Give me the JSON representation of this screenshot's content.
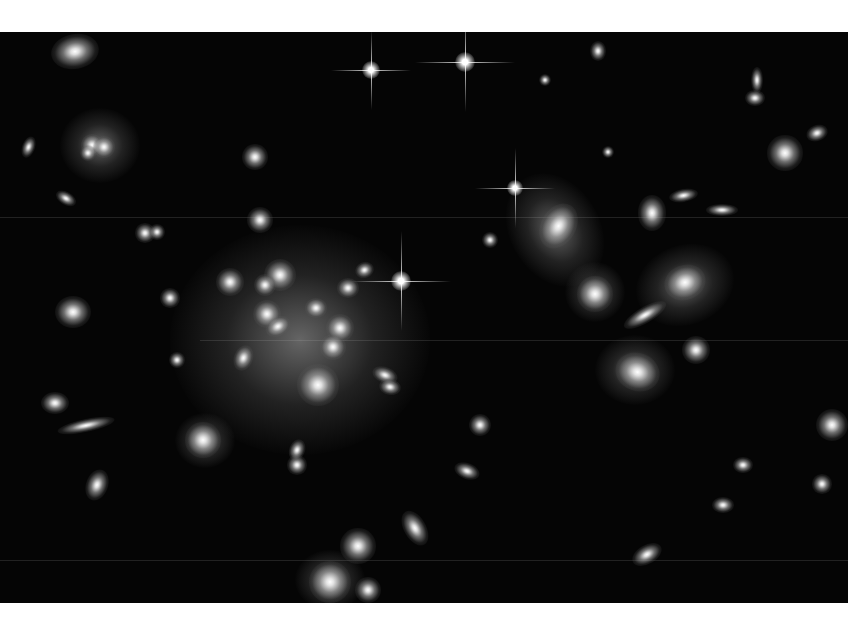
{
  "image": {
    "subject": "galaxy cluster deep field",
    "background": "#050505",
    "margin_color": "#ffffff",
    "frame": {
      "x": 0,
      "y": 32,
      "w": 848,
      "h": 571
    }
  },
  "halos": [
    {
      "x": 300,
      "y": 340,
      "w": 260,
      "h": 230,
      "r": 0
    },
    {
      "x": 100,
      "y": 145,
      "w": 80,
      "h": 75,
      "r": 0
    },
    {
      "x": 555,
      "y": 230,
      "w": 90,
      "h": 120,
      "r": -30
    },
    {
      "x": 685,
      "y": 285,
      "w": 100,
      "h": 80,
      "r": -20
    },
    {
      "x": 635,
      "y": 370,
      "w": 80,
      "h": 70,
      "r": 0
    },
    {
      "x": 595,
      "y": 292,
      "w": 60,
      "h": 60,
      "r": 0
    },
    {
      "x": 330,
      "y": 580,
      "w": 70,
      "h": 60,
      "r": 0
    },
    {
      "x": 205,
      "y": 440,
      "w": 60,
      "h": 55,
      "r": 0
    }
  ],
  "galaxies": [
    {
      "x": 75,
      "y": 52,
      "w": 30,
      "h": 22,
      "r": -10
    },
    {
      "x": 92,
      "y": 145,
      "w": 14,
      "h": 14,
      "r": 0
    },
    {
      "x": 104,
      "y": 147,
      "w": 14,
      "h": 14,
      "r": 0
    },
    {
      "x": 88,
      "y": 153,
      "w": 10,
      "h": 10,
      "r": 0
    },
    {
      "x": 73,
      "y": 312,
      "w": 22,
      "h": 20,
      "r": 0
    },
    {
      "x": 230,
      "y": 282,
      "w": 18,
      "h": 18,
      "r": 0
    },
    {
      "x": 280,
      "y": 275,
      "w": 20,
      "h": 20,
      "r": 0
    },
    {
      "x": 265,
      "y": 285,
      "w": 14,
      "h": 14,
      "r": 0
    },
    {
      "x": 267,
      "y": 314,
      "w": 18,
      "h": 18,
      "r": 0
    },
    {
      "x": 278,
      "y": 327,
      "w": 16,
      "h": 12,
      "r": -30
    },
    {
      "x": 316,
      "y": 308,
      "w": 14,
      "h": 12,
      "r": 0
    },
    {
      "x": 340,
      "y": 328,
      "w": 18,
      "h": 18,
      "r": 0
    },
    {
      "x": 333,
      "y": 347,
      "w": 16,
      "h": 16,
      "r": 0
    },
    {
      "x": 348,
      "y": 288,
      "w": 14,
      "h": 12,
      "r": 0
    },
    {
      "x": 365,
      "y": 270,
      "w": 12,
      "h": 10,
      "r": -20
    },
    {
      "x": 318,
      "y": 385,
      "w": 26,
      "h": 26,
      "r": 0
    },
    {
      "x": 244,
      "y": 358,
      "w": 12,
      "h": 16,
      "r": 20
    },
    {
      "x": 385,
      "y": 375,
      "w": 16,
      "h": 10,
      "r": 20
    },
    {
      "x": 390,
      "y": 387,
      "w": 14,
      "h": 10,
      "r": 10
    },
    {
      "x": 260,
      "y": 220,
      "w": 16,
      "h": 16,
      "r": 0
    },
    {
      "x": 255,
      "y": 157,
      "w": 16,
      "h": 16,
      "r": 0
    },
    {
      "x": 170,
      "y": 298,
      "w": 12,
      "h": 12,
      "r": 0
    },
    {
      "x": 177,
      "y": 360,
      "w": 10,
      "h": 10,
      "r": 0
    },
    {
      "x": 203,
      "y": 440,
      "w": 22,
      "h": 22,
      "r": 0
    },
    {
      "x": 297,
      "y": 465,
      "w": 12,
      "h": 12,
      "r": 0
    },
    {
      "x": 297,
      "y": 450,
      "w": 10,
      "h": 14,
      "r": 20
    },
    {
      "x": 55,
      "y": 403,
      "w": 18,
      "h": 14,
      "r": 0
    },
    {
      "x": 86,
      "y": 425,
      "w": 36,
      "h": 8,
      "r": -12
    },
    {
      "x": 97,
      "y": 485,
      "w": 14,
      "h": 20,
      "r": 20
    },
    {
      "x": 559,
      "y": 226,
      "w": 22,
      "h": 30,
      "r": 30
    },
    {
      "x": 595,
      "y": 294,
      "w": 22,
      "h": 22,
      "r": 0
    },
    {
      "x": 685,
      "y": 283,
      "w": 26,
      "h": 22,
      "r": -20
    },
    {
      "x": 645,
      "y": 315,
      "w": 30,
      "h": 10,
      "r": -30
    },
    {
      "x": 637,
      "y": 372,
      "w": 28,
      "h": 24,
      "r": 20
    },
    {
      "x": 696,
      "y": 350,
      "w": 18,
      "h": 18,
      "r": 0
    },
    {
      "x": 652,
      "y": 213,
      "w": 18,
      "h": 22,
      "r": 0
    },
    {
      "x": 683,
      "y": 195,
      "w": 18,
      "h": 8,
      "r": -10
    },
    {
      "x": 722,
      "y": 210,
      "w": 20,
      "h": 8,
      "r": 0
    },
    {
      "x": 785,
      "y": 153,
      "w": 22,
      "h": 22,
      "r": 0
    },
    {
      "x": 757,
      "y": 80,
      "w": 8,
      "h": 16,
      "r": 0
    },
    {
      "x": 755,
      "y": 98,
      "w": 12,
      "h": 10,
      "r": 0
    },
    {
      "x": 817,
      "y": 133,
      "w": 14,
      "h": 10,
      "r": -20
    },
    {
      "x": 832,
      "y": 425,
      "w": 20,
      "h": 20,
      "r": 0
    },
    {
      "x": 480,
      "y": 425,
      "w": 14,
      "h": 14,
      "r": 0
    },
    {
      "x": 467,
      "y": 471,
      "w": 16,
      "h": 10,
      "r": 20
    },
    {
      "x": 415,
      "y": 528,
      "w": 14,
      "h": 24,
      "r": -30
    },
    {
      "x": 358,
      "y": 546,
      "w": 22,
      "h": 22,
      "r": 0
    },
    {
      "x": 330,
      "y": 582,
      "w": 26,
      "h": 26,
      "r": 0
    },
    {
      "x": 368,
      "y": 590,
      "w": 16,
      "h": 16,
      "r": 0
    },
    {
      "x": 647,
      "y": 555,
      "w": 20,
      "h": 12,
      "r": -30
    },
    {
      "x": 723,
      "y": 505,
      "w": 14,
      "h": 10,
      "r": 0
    },
    {
      "x": 743,
      "y": 465,
      "w": 12,
      "h": 10,
      "r": 0
    },
    {
      "x": 822,
      "y": 484,
      "w": 12,
      "h": 12,
      "r": 0
    },
    {
      "x": 598,
      "y": 51,
      "w": 10,
      "h": 12,
      "r": 0
    },
    {
      "x": 545,
      "y": 80,
      "w": 8,
      "h": 8,
      "r": 0
    },
    {
      "x": 28,
      "y": 147,
      "w": 8,
      "h": 14,
      "r": 20
    },
    {
      "x": 66,
      "y": 198,
      "w": 14,
      "h": 8,
      "r": 30
    },
    {
      "x": 145,
      "y": 233,
      "w": 12,
      "h": 12,
      "r": 0
    },
    {
      "x": 157,
      "y": 232,
      "w": 10,
      "h": 10,
      "r": 0
    },
    {
      "x": 490,
      "y": 240,
      "w": 10,
      "h": 10,
      "r": 0
    },
    {
      "x": 608,
      "y": 152,
      "w": 8,
      "h": 8,
      "r": 0
    }
  ],
  "stars": [
    {
      "x": 371,
      "y": 70,
      "core": 18,
      "spike": 40
    },
    {
      "x": 465,
      "y": 62,
      "core": 20,
      "spike": 50
    },
    {
      "x": 515,
      "y": 188,
      "core": 16,
      "spike": 40
    },
    {
      "x": 401,
      "y": 281,
      "core": 20,
      "spike": 50
    }
  ],
  "streaks": [
    {
      "x": 0,
      "y": 217,
      "w": 848
    },
    {
      "x": 0,
      "y": 560,
      "w": 848
    },
    {
      "x": 200,
      "y": 340,
      "w": 648
    }
  ]
}
